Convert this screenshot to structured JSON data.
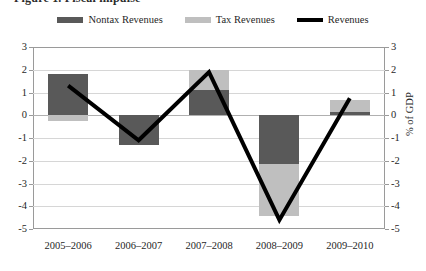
{
  "caption": {
    "sliver_text": "Figure 1.  Fiscal impulse"
  },
  "legend": {
    "position": "top-center",
    "items": [
      {
        "label": "Nontax Revenues",
        "color": "#595959",
        "marker": "swatch"
      },
      {
        "label": "Tax Revenues",
        "color": "#bfbfbf",
        "marker": "swatch"
      },
      {
        "label": "Revenues",
        "color": "#000000",
        "marker": "line"
      }
    ]
  },
  "axes": {
    "left_title": "",
    "right_title": "% of GDP",
    "y_ticks": [
      "3",
      "2",
      "1",
      "0",
      "-1",
      "-2",
      "-3",
      "-4",
      "-5"
    ],
    "x_ticks": [
      "2005–2006",
      "2006–2007",
      "2007–2008",
      "2008–2009",
      "2009–2010"
    ]
  },
  "chart_data": {
    "type": "bar",
    "title": "",
    "subtitle": "",
    "xlabel": "",
    "ylabel": "% of GDP",
    "ylim": [
      -5,
      3
    ],
    "yticks": [
      3,
      2,
      1,
      0,
      -1,
      -2,
      -3,
      -4,
      -5
    ],
    "grid": true,
    "legend_position": "top-center",
    "stacked": true,
    "categories": [
      "2005–2006",
      "2006–2007",
      "2007–2008",
      "2008–2009",
      "2009–2010"
    ],
    "series": [
      {
        "name": "Nontax Revenues",
        "type": "bar",
        "color": "#595959",
        "values": [
          1.8,
          -1.3,
          1.1,
          -2.15,
          0.15
        ]
      },
      {
        "name": "Tax Revenues",
        "type": "bar",
        "color": "#bfbfbf",
        "values": [
          -0.25,
          0.0,
          0.9,
          -2.3,
          0.5
        ]
      },
      {
        "name": "Revenues",
        "type": "line",
        "color": "#000000",
        "values": [
          1.3,
          -1.1,
          1.9,
          -4.6,
          0.75
        ]
      }
    ]
  }
}
